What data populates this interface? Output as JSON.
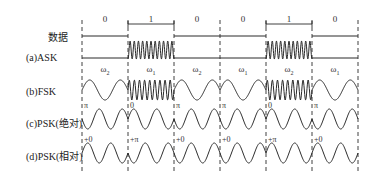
{
  "row_labels": {
    "data": "数据",
    "ask": "(a)ASK",
    "fsk": "(b)FSK",
    "psk_abs": "(c)PSK(绝对)",
    "psk_rel": "(d)PSK(相对)"
  },
  "bits": [
    "0",
    "1",
    "0",
    "0",
    "1",
    "0"
  ],
  "fsk_freqs": [
    {
      "sym": "ω",
      "sub": "2"
    },
    {
      "sym": "ω",
      "sub": "1"
    },
    {
      "sym": "ω",
      "sub": "2"
    },
    {
      "sym": "ω",
      "sub": "1"
    },
    {
      "sym": "ω",
      "sub": "2"
    },
    {
      "sym": "ω",
      "sub": "1"
    }
  ],
  "psk_abs_marks": [
    {
      "boundary": 0,
      "text": "π"
    },
    {
      "boundary": 1,
      "text": "0"
    },
    {
      "boundary": 2,
      "text": "π"
    },
    {
      "boundary": 3,
      "text": "π"
    },
    {
      "boundary": 4,
      "text": "0"
    },
    {
      "boundary": 5,
      "text": "π"
    }
  ],
  "psk_rel_marks": [
    {
      "boundary": 0,
      "text": "+0"
    },
    {
      "boundary": 1,
      "text": "+π"
    },
    {
      "boundary": 2,
      "text": "+0"
    },
    {
      "boundary": 3,
      "text": "+0"
    },
    {
      "boundary": 4,
      "text": "+π"
    },
    {
      "boundary": 5,
      "text": "+0"
    }
  ],
  "colors": {
    "line": "#2a2a2a",
    "text": "#222222",
    "background": "#ffffff"
  }
}
